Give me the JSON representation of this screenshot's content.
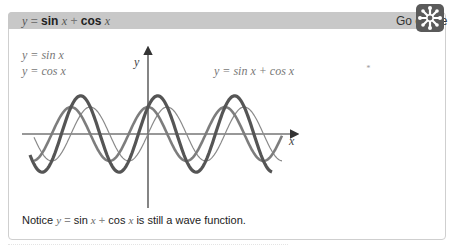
{
  "header": {
    "title_y": "y",
    "title_eq": "=",
    "title_sin": "sin",
    "title_x1": "x",
    "title_plus": "+",
    "title_cos": "cos",
    "title_x2": "x",
    "go_online": "Go online",
    "go_online_icon": "snowflake-network-icon"
  },
  "graph": {
    "legend": [
      "y = sin x",
      "y = cos x"
    ],
    "sum_label": "y = sin x + cos x",
    "x_axis_label": "x",
    "y_axis_label": "y",
    "stray_mark": "*",
    "colors": {
      "sin": "#8a8a8a",
      "cos": "#808080",
      "sum": "#555555",
      "axis": "#333333"
    }
  },
  "note": {
    "prefix": "Notice",
    "y": "y",
    "eq": "=",
    "sin": "sin",
    "x1": "x",
    "plus": "+",
    "cos": "cos",
    "x2": "x",
    "suffix": "is still a wave function."
  }
}
